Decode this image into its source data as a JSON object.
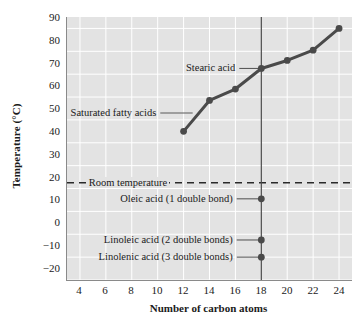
{
  "chart_data": {
    "type": "line",
    "title": "",
    "xlabel": "Number of carbon atoms",
    "ylabel": "Temperature (°C)",
    "xlim": [
      3,
      25
    ],
    "ylim": [
      -20,
      95
    ],
    "xticks": [
      4,
      6,
      8,
      10,
      12,
      14,
      16,
      18,
      20,
      22,
      24
    ],
    "yticks": [
      -20,
      -10,
      0,
      10,
      20,
      30,
      40,
      50,
      60,
      70,
      80,
      90
    ],
    "grid": true,
    "legend": "none",
    "series": [
      {
        "name": "Saturated fatty acids",
        "marker": "filled-circle",
        "color": "#4a4a4a",
        "x": [
          12,
          14,
          16,
          18,
          20,
          22,
          24
        ],
        "values": [
          45,
          58.5,
          63.5,
          72.5,
          76,
          80.5,
          90
        ]
      },
      {
        "name": "Unsaturated fatty acids",
        "marker": "filled-circle",
        "color": "#4a4a4a",
        "points": [
          {
            "label": "Oleic acid (1 double bond)",
            "x": 18,
            "y": 15.5
          },
          {
            "label": "Linoleic acid (2 double bonds)",
            "x": 18,
            "y": -2.5
          },
          {
            "label": "Linolenic acid (3 double bonds)",
            "x": 18,
            "y": -10
          }
        ]
      }
    ],
    "reference_lines": [
      {
        "name": "Room temperature",
        "orientation": "horizontal",
        "y": 22.5,
        "style": "dashed",
        "label": "Room temperature"
      },
      {
        "name": "C18 marker",
        "orientation": "vertical",
        "x": 18,
        "style": "solid",
        "label": ""
      }
    ],
    "annotations": [
      {
        "name": "stearic-acid",
        "text": "Stearic acid",
        "x": 18,
        "y": 72.5
      },
      {
        "name": "saturated-fatty-acids",
        "text": "Saturated fatty acids",
        "x": 13,
        "y": 53
      },
      {
        "name": "oleic-acid",
        "text": "Oleic acid (1 double bond)",
        "x": 18,
        "y": 15.5
      },
      {
        "name": "linoleic-acid",
        "text": "Linoleic acid (2 double bonds)",
        "x": 18,
        "y": -2.5
      },
      {
        "name": "linolenic-acid",
        "text": "Linolenic acid (3 double bonds)",
        "x": 18,
        "y": -10
      }
    ]
  },
  "axes": {
    "y_title": "Temperature (°C)",
    "x_title": "Number of carbon atoms",
    "y_labels": [
      "90",
      "80",
      "70",
      "60",
      "50",
      "40",
      "30",
      "20",
      "10",
      "0",
      "−10",
      "−20"
    ],
    "x_labels": [
      "4",
      "6",
      "8",
      "10",
      "12",
      "14",
      "16",
      "18",
      "20",
      "22",
      "24"
    ]
  },
  "annotations": {
    "stearic_acid": "Stearic acid",
    "saturated_fatty_acids": "Saturated fatty acids",
    "room_temperature": "Room temperature",
    "oleic_acid": "Oleic acid (1 double bond)",
    "linoleic_acid": "Linoleic acid (2 double bonds)",
    "linolenic_acid": "Linolenic acid (3 double bonds)"
  },
  "colors": {
    "plot_background": "#e3e3e3",
    "gridline": "#ffffff",
    "axis": "#8a8a8a",
    "data_line": "#4a4a4a",
    "text": "#1a1a1a"
  }
}
